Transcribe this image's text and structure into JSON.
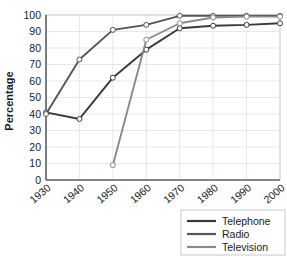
{
  "chart_data": {
    "type": "line",
    "title": "",
    "xlabel": "",
    "ylabel": "Percentage",
    "x": [
      1930,
      1940,
      1950,
      1960,
      1970,
      1980,
      1990,
      2000
    ],
    "xtick_labels": [
      "1930",
      "1940",
      "1950",
      "1960",
      "1970",
      "1980",
      "1990",
      "2000"
    ],
    "ytick_labels": [
      "0",
      "10",
      "20",
      "30",
      "40",
      "50",
      "60",
      "70",
      "80",
      "90",
      "100"
    ],
    "yticks": [
      0,
      10,
      20,
      30,
      40,
      50,
      60,
      70,
      80,
      90,
      100
    ],
    "ylim": [
      0,
      100
    ],
    "xlim": [
      1930,
      2000
    ],
    "grid": true,
    "legend_position": "bottom-right",
    "markers": "open-circle",
    "series": [
      {
        "name": "Telephone",
        "color": "#3a3a3a",
        "values": [
          41,
          37,
          62,
          79,
          92,
          93.5,
          94,
          95
        ]
      },
      {
        "name": "Radio",
        "color": "#555555",
        "values": [
          40,
          73,
          91,
          94,
          99.5,
          99.5,
          99.5,
          99.5
        ]
      },
      {
        "name": "Television",
        "color": "#8a8a8a",
        "values": [
          null,
          null,
          9,
          85,
          95,
          98.5,
          99,
          99
        ]
      }
    ]
  },
  "legend": {
    "entries": [
      {
        "label": "Telephone",
        "color": "#3a3a3a"
      },
      {
        "label": "Radio",
        "color": "#555555"
      },
      {
        "label": "Television",
        "color": "#8a8a8a"
      }
    ]
  },
  "axis": {
    "y_title": "Percentage"
  }
}
